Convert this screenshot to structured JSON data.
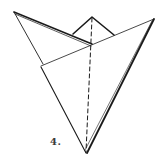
{
  "diagram": {
    "type": "origami-fold-step",
    "step_label": "4.",
    "colors": {
      "line": "#1a1a1a",
      "background": "#ffffff",
      "label": "#3a3a3a"
    },
    "points": {
      "top_left_apex": [
        14,
        12
      ],
      "small_peak_apex": [
        92,
        17
      ],
      "small_peak_left_base": [
        73,
        33
      ],
      "small_peak_right_base": [
        114,
        35
      ],
      "center_junction": [
        92,
        45
      ],
      "right_apex": [
        154,
        19
      ],
      "left_notch_upper": [
        43,
        64
      ],
      "left_notch_lower": [
        41,
        67
      ],
      "bottom_point": [
        86,
        153
      ]
    },
    "lines": [
      {
        "name": "top-left-edge-outer",
        "style": "solid",
        "weight": "heavy"
      },
      {
        "name": "top-left-edge-inner",
        "style": "solid",
        "weight": "thin"
      },
      {
        "name": "left-upper-edge",
        "style": "solid",
        "weight": "thin"
      },
      {
        "name": "left-lower-edge",
        "style": "solid",
        "weight": "medium"
      },
      {
        "name": "cross-fold-line",
        "style": "solid",
        "weight": "thin"
      },
      {
        "name": "right-edge",
        "style": "solid",
        "weight": "heavy"
      },
      {
        "name": "small-peak",
        "style": "solid",
        "weight": "heavy"
      },
      {
        "name": "center-valley-fold",
        "style": "dashed",
        "weight": "medium"
      }
    ]
  }
}
